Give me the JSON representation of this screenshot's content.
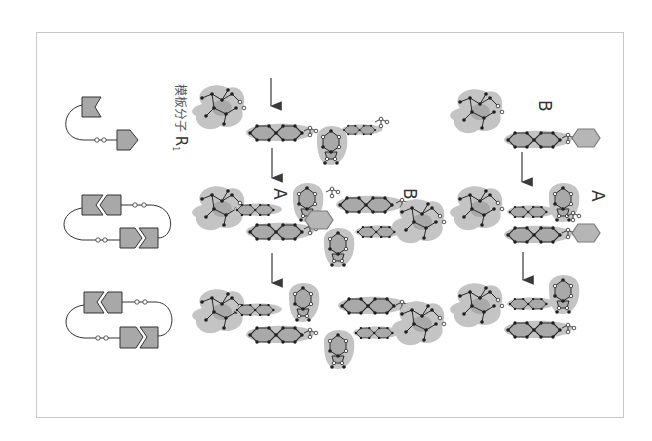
{
  "figure": {
    "template_label": "模板分子",
    "template_symbol": "R",
    "template_subscript": "1",
    "labels": {
      "middle_A": "A",
      "middle_B": "B",
      "right_B": "B",
      "right_A": "A"
    },
    "colors": {
      "blob_fill": "#c4c4c4",
      "blob_edge": "#b0b0b0",
      "bond": "#2a2a2a",
      "atom_filled": "#1e1e1e",
      "atom_open": "#ffffff",
      "ring_fill": "#a9a9a9",
      "schematic_fill": "#a8a8a8",
      "frame": "#c8c8c8",
      "arrow": "#3a3a3a"
    },
    "schematics": [
      {
        "name": "template-schematic",
        "state": "open"
      },
      {
        "name": "complex-schematic",
        "state": "bound"
      },
      {
        "name": "product-schematic",
        "state": "bound"
      }
    ],
    "arrows": [
      {
        "name": "arrow-left-1"
      },
      {
        "name": "arrow-left-2"
      },
      {
        "name": "arrow-left-3"
      },
      {
        "name": "arrow-right-1"
      },
      {
        "name": "arrow-right-2"
      }
    ]
  }
}
